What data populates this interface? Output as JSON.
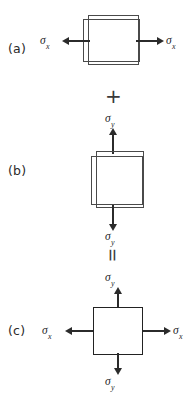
{
  "figure": {
    "background_color": "#ffffff",
    "line_color": "#2e2e2e",
    "arrow_color": "#2b2b2b"
  },
  "symbols": {
    "sigma": "σ",
    "sub_x": "x",
    "sub_y": "y",
    "plus": "+",
    "equals": "="
  },
  "panels": [
    {
      "id": "a",
      "label": "(a)",
      "description": "uniaxial tension in x direction",
      "arrows": [
        {
          "name": "sigma-x-left",
          "direction": "left",
          "label_sigma": "σ",
          "label_sub": "x"
        },
        {
          "name": "sigma-x-right",
          "direction": "right",
          "label_sigma": "σ",
          "label_sub": "x"
        }
      ]
    },
    {
      "id": "b",
      "label": "(b)",
      "description": "uniaxial tension in y direction",
      "arrows": [
        {
          "name": "sigma-y-up",
          "direction": "up",
          "label_sigma": "σ",
          "label_sub": "y"
        },
        {
          "name": "sigma-y-down",
          "direction": "down",
          "label_sigma": "σ",
          "label_sub": "y"
        }
      ]
    },
    {
      "id": "c",
      "label": "(c)",
      "description": "resulting biaxial stress state",
      "arrows": [
        {
          "name": "sigma-x-left",
          "direction": "left",
          "label_sigma": "σ",
          "label_sub": "x"
        },
        {
          "name": "sigma-x-right",
          "direction": "right",
          "label_sigma": "σ",
          "label_sub": "x"
        },
        {
          "name": "sigma-y-up",
          "direction": "up",
          "label_sigma": "σ",
          "label_sub": "y"
        },
        {
          "name": "sigma-y-down",
          "direction": "down",
          "label_sigma": "σ",
          "label_sub": "y"
        }
      ]
    }
  ],
  "operators": [
    {
      "name": "plus-operator",
      "glyph": "+"
    },
    {
      "name": "equals-operator",
      "glyph": "="
    }
  ]
}
